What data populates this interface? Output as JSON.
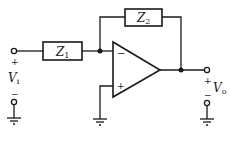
{
  "diagram": {
    "type": "inverting-op-amp-circuit",
    "components": {
      "z1": {
        "label": "Z",
        "subscript": "1"
      },
      "z2": {
        "label": "Z",
        "subscript": "2"
      },
      "opamp": {
        "inverting_sign": "−",
        "noninverting_sign": "+"
      }
    },
    "input": {
      "label": "V",
      "subscript": "i",
      "plus": "+",
      "minus": "−"
    },
    "output": {
      "label": "V",
      "subscript": "o",
      "plus": "+",
      "minus": "−"
    }
  },
  "colors": {
    "line": "#1a1a1a",
    "background": "#ffffff"
  }
}
